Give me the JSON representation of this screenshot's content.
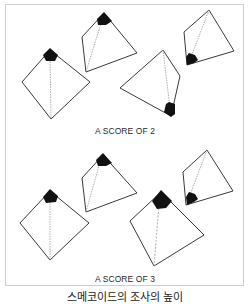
{
  "panels": [
    {
      "caption": "A SCORE OF 2",
      "figures": [
        {
          "name": "pyramid-1",
          "cap_position": "top"
        },
        {
          "name": "pyramid-2",
          "cap_position": "top"
        },
        {
          "name": "pyramid-3",
          "cap_position": "bottom"
        },
        {
          "name": "pyramid-4",
          "cap_position": "bottom-left"
        }
      ]
    },
    {
      "caption": "A SCORE OF 3",
      "figures": [
        {
          "name": "pyramid-5",
          "cap_position": "top"
        },
        {
          "name": "pyramid-6",
          "cap_position": "top"
        },
        {
          "name": "pyramid-7",
          "cap_position": "top"
        },
        {
          "name": "pyramid-8",
          "cap_position": "bottom-left"
        }
      ]
    }
  ],
  "footer_caption": "스메코이드의 조사의 높이",
  "colors": {
    "stroke": "#3a3a3a",
    "fill": "#111111",
    "dotted": "#9a9a9a",
    "frame": "#cfcfcf"
  }
}
